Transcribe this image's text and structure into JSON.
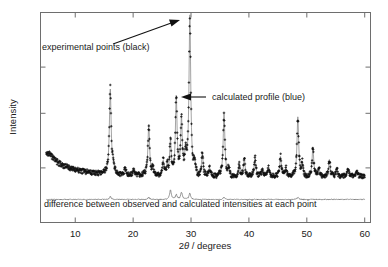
{
  "figure": {
    "kind": "rietveld-refinement-powder-diffraction-plot",
    "background_color": "#ffffff",
    "frame_color": "#6e6e6e",
    "observed_color": "#111111",
    "calculated_color": "#7d7d7d",
    "difference_color": "#555555"
  },
  "annotations": {
    "experimental_points": "experimental points (black)",
    "calculated_profile": "calculated profile (blue)",
    "difference_curve": "difference between observed and calculated intensities at each point"
  },
  "chart_data": {
    "type": "line",
    "title": "",
    "subtitle": "",
    "xlabel": "2θ / degrees",
    "ylabel": "Intensity",
    "xlim": [
      4.0,
      61.0
    ],
    "ylim": [
      0,
      100
    ],
    "grid": false,
    "legend_position": "none",
    "xticks": [
      10,
      20,
      30,
      40,
      50,
      60
    ],
    "xtick_labels": [
      "10",
      "20",
      "30",
      "40",
      "50",
      "60"
    ],
    "yticks": [],
    "ytick_labels": [],
    "x_minor_ticks": [],
    "notes": [
      "Observed data drawn as black '+' markers",
      "Calculated profile drawn as a continuous blue/grey line through the markers",
      "Difference curve (obs - calc) plotted as a flat trace below the main pattern"
    ],
    "series": [
      {
        "name": "experimental points (black)",
        "role": "observed",
        "marker": "plus",
        "color": "#111111",
        "baseline": 22.0,
        "background": [
          {
            "x": 5.0,
            "y": 34.0
          },
          {
            "x": 6.0,
            "y": 31.0
          },
          {
            "x": 7.0,
            "y": 28.6
          },
          {
            "x": 8.0,
            "y": 27.0
          },
          {
            "x": 9.5,
            "y": 25.6
          },
          {
            "x": 11.0,
            "y": 24.6
          },
          {
            "x": 13.0,
            "y": 23.8
          },
          {
            "x": 16.0,
            "y": 23.2
          },
          {
            "x": 20.0,
            "y": 22.8
          },
          {
            "x": 25.0,
            "y": 22.5
          },
          {
            "x": 30.0,
            "y": 22.3
          },
          {
            "x": 36.0,
            "y": 22.2
          },
          {
            "x": 42.0,
            "y": 22.1
          },
          {
            "x": 48.0,
            "y": 22.1
          },
          {
            "x": 54.0,
            "y": 22.0
          },
          {
            "x": 60.0,
            "y": 22.0
          }
        ],
        "peaks": [
          {
            "x": 16.05,
            "height": 40.0,
            "width": 0.18
          },
          {
            "x": 16.55,
            "height": 4.0,
            "width": 0.16
          },
          {
            "x": 18.6,
            "height": 3.0,
            "width": 0.16
          },
          {
            "x": 20.1,
            "height": 2.5,
            "width": 0.15
          },
          {
            "x": 22.7,
            "height": 24.0,
            "width": 0.17
          },
          {
            "x": 23.4,
            "height": 3.0,
            "width": 0.15
          },
          {
            "x": 25.2,
            "height": 7.0,
            "width": 0.16
          },
          {
            "x": 25.9,
            "height": 5.0,
            "width": 0.15
          },
          {
            "x": 26.45,
            "height": 16.0,
            "width": 0.16
          },
          {
            "x": 27.45,
            "height": 37.0,
            "width": 0.17
          },
          {
            "x": 28.35,
            "height": 27.0,
            "width": 0.17
          },
          {
            "x": 29.05,
            "height": 10.0,
            "width": 0.16
          },
          {
            "x": 29.8,
            "height": 76.0,
            "width": 0.18
          },
          {
            "x": 30.6,
            "height": 6.0,
            "width": 0.15
          },
          {
            "x": 31.95,
            "height": 11.0,
            "width": 0.16
          },
          {
            "x": 33.2,
            "height": 4.0,
            "width": 0.15
          },
          {
            "x": 35.7,
            "height": 30.0,
            "width": 0.17
          },
          {
            "x": 36.5,
            "height": 3.5,
            "width": 0.15
          },
          {
            "x": 38.3,
            "height": 5.5,
            "width": 0.15
          },
          {
            "x": 39.2,
            "height": 8.5,
            "width": 0.16
          },
          {
            "x": 41.05,
            "height": 9.0,
            "width": 0.16
          },
          {
            "x": 42.3,
            "height": 3.0,
            "width": 0.15
          },
          {
            "x": 43.4,
            "height": 4.5,
            "width": 0.15
          },
          {
            "x": 45.45,
            "height": 9.5,
            "width": 0.16
          },
          {
            "x": 46.4,
            "height": 4.0,
            "width": 0.15
          },
          {
            "x": 48.45,
            "height": 28.0,
            "width": 0.17
          },
          {
            "x": 49.2,
            "height": 6.0,
            "width": 0.15
          },
          {
            "x": 51.05,
            "height": 14.0,
            "width": 0.16
          },
          {
            "x": 52.1,
            "height": 4.0,
            "width": 0.15
          },
          {
            "x": 53.9,
            "height": 8.0,
            "width": 0.16
          },
          {
            "x": 55.2,
            "height": 3.5,
            "width": 0.15
          },
          {
            "x": 57.1,
            "height": 4.0,
            "width": 0.15
          },
          {
            "x": 58.6,
            "height": 3.0,
            "width": 0.15
          }
        ]
      },
      {
        "name": "calculated profile (blue)",
        "role": "calculated",
        "color": "#7d7d7d",
        "follows": "experimental points (black)"
      },
      {
        "name": "difference between observed and calculated intensities at each point",
        "role": "difference",
        "color": "#555555",
        "baseline": 11.0,
        "spikes": [
          {
            "x": 16.05,
            "height": 1.4
          },
          {
            "x": 22.7,
            "height": 1.0
          },
          {
            "x": 26.45,
            "height": 4.6
          },
          {
            "x": 27.45,
            "height": 2.2
          },
          {
            "x": 28.35,
            "height": 3.4
          },
          {
            "x": 29.8,
            "height": 3.0
          },
          {
            "x": 35.7,
            "height": 1.0
          },
          {
            "x": 48.45,
            "height": 0.9
          }
        ]
      }
    ]
  }
}
